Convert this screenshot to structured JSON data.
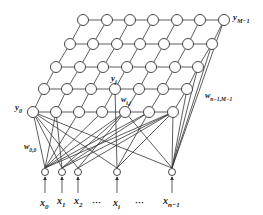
{
  "diagram": {
    "type": "neural-network-lattice",
    "grid": {
      "rows": 5,
      "cols": 7
    },
    "labels": {
      "y_top_right": "y",
      "y_top_right_sub": "M−1",
      "y_j": "y",
      "y_j_sub": "j",
      "y_0": "y",
      "y_0_sub": "0",
      "w_ij": "w",
      "w_ij_sub": "i,j",
      "w_00": "w",
      "w_00_sub": "0,0",
      "w_last": "w",
      "w_last_sub": "n−1,M−1"
    },
    "inputs": [
      {
        "label": "x",
        "sub": "0"
      },
      {
        "label": "x",
        "sub": "1"
      },
      {
        "label": "x",
        "sub": "2"
      },
      {
        "label": "···",
        "sub": ""
      },
      {
        "label": "x",
        "sub": "i"
      },
      {
        "label": "···",
        "sub": ""
      },
      {
        "label": "x",
        "sub": "n−1"
      }
    ],
    "colors": {
      "stroke": "#333333",
      "node_fill": "#ffffff",
      "background": "#ffffff"
    }
  }
}
